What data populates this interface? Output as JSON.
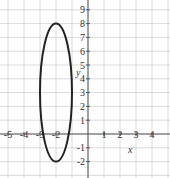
{
  "chart_data": {
    "type": "line",
    "title": "",
    "xlabel": "x",
    "ylabel": "y",
    "xlim": [
      -5,
      5
    ],
    "ylim": [
      -3,
      9
    ],
    "grid": true,
    "x_ticks": [
      -5,
      -4,
      -3,
      -2,
      1,
      2,
      3,
      4
    ],
    "x_tick_labels": [
      "-5",
      "-4",
      "-3",
      "-2",
      "1",
      "2",
      "3",
      "4"
    ],
    "y_ticks": [
      9,
      8,
      7,
      6,
      5,
      4,
      3,
      2,
      1,
      -1,
      -2
    ],
    "y_tick_labels": [
      "9",
      "8",
      "7",
      "6",
      "5",
      "4",
      "3",
      "2",
      "1",
      "-1",
      "-2"
    ],
    "series": [
      {
        "name": "ellipse",
        "equation": "(x+2)^2/1 + (y-3)^2/25 = 1",
        "center": [
          -2,
          3
        ],
        "semi_axis_x": 1,
        "semi_axis_y": 5,
        "color": "#222222"
      }
    ]
  }
}
